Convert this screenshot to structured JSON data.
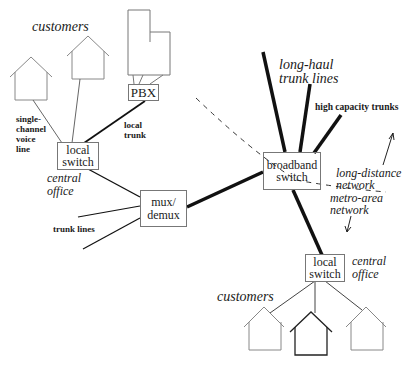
{
  "diagram": {
    "nodes": {
      "pbx": {
        "label": "PBX"
      },
      "local_switch_top": {
        "line1": "local",
        "line2": "switch"
      },
      "mux_demux": {
        "line1": "mux/",
        "line2": "demux"
      },
      "broadband_switch": {
        "line1": "broadband",
        "line2": "switch"
      },
      "local_switch_bottom": {
        "line1": "local",
        "line2": "switch"
      }
    },
    "labels": {
      "customers_top": "customers",
      "customers_bottom": "customers",
      "single_channel": [
        "single-",
        "channel",
        "voice",
        "line"
      ],
      "local_trunk": [
        "local",
        "trunk"
      ],
      "central_office_top": [
        "central",
        "office"
      ],
      "central_office_bottom": [
        "central",
        "office"
      ],
      "trunk_lines": "trunk lines",
      "long_haul": [
        "long-haul",
        "trunk lines"
      ],
      "high_capacity": "high capacity trunks",
      "long_distance": [
        "long-distance",
        "network"
      ],
      "metro_area": [
        "metro-area",
        "network"
      ]
    },
    "colors": {
      "line": "#111111",
      "house": "#888888",
      "house_highlight": "#222222",
      "dash": "#333333"
    }
  }
}
